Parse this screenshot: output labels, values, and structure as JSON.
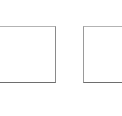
{
  "canvas": {
    "width": 122,
    "height": 116,
    "background_color": "#ffffff",
    "description": "Two thin outlined rectangles on a plain white background"
  },
  "shapes": [
    {
      "name": "left-square",
      "label": "",
      "kind": "rectangle-outline",
      "fill_color": "#ffffff",
      "border_color": "#8a8a8a",
      "border_width_px": 1,
      "x": 0,
      "y": 26,
      "width": 55,
      "height": 57,
      "clipped_edge": "left"
    },
    {
      "name": "right-rectangle",
      "label": "",
      "kind": "rectangle-outline",
      "fill_color": "#ffffff",
      "border_color": "#8a8a8a",
      "border_width_px": 1,
      "x": 83,
      "y": 26,
      "width": 39,
      "height": 57,
      "clipped_edge": "right"
    }
  ],
  "colors": {
    "background": "#ffffff",
    "outline_top": "#b3b3b3",
    "outline_side": "#8a8a8a",
    "outline_bottom": "#6e6e6e",
    "interior": "#ffffff"
  }
}
